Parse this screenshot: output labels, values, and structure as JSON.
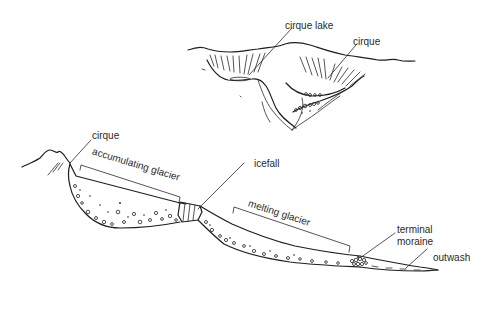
{
  "diagram": {
    "top_view": {
      "labels": {
        "cirque_lake": "cirque lake",
        "cirque": "cirque"
      }
    },
    "profile_view": {
      "labels": {
        "cirque": "cirque",
        "accumulating_glacier": "accumulating glacier",
        "icefall": "icefall",
        "melting_glacier": "melting glacier",
        "terminal_moraine_line1": "terminal",
        "terminal_moraine_line2": "moraine",
        "outwash": "outwash"
      }
    },
    "colors": {
      "ink": "#1e1e1e",
      "background": "#ffffff"
    }
  }
}
